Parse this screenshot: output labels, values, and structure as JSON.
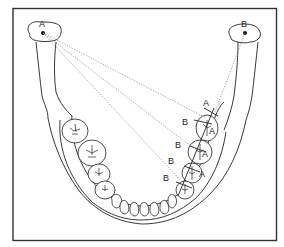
{
  "diagram": {
    "labels": {
      "condyle_left": "A",
      "condyle_right": "B",
      "tooth_A_1": "A",
      "tooth_A_2": "A",
      "tooth_A_3": "A",
      "tooth_A_4": "A",
      "tooth_B_1": "B",
      "tooth_B_2": "B",
      "tooth_B_3": "B",
      "tooth_B_4": "B"
    },
    "colors": {
      "line": "#222222",
      "dotted": "#888888",
      "frame": "#333333",
      "background": "#ffffff"
    }
  }
}
